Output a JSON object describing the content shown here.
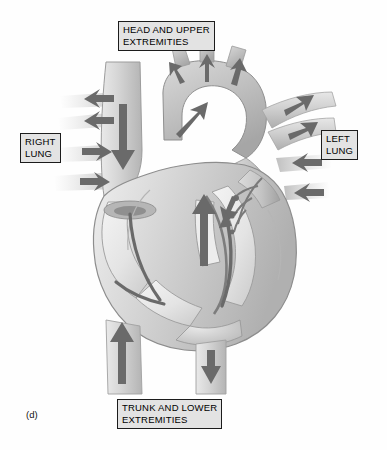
{
  "figure": {
    "panel_letter": "(d)",
    "title_text": "",
    "background_color": "#fefefe",
    "label_box_fill": "#e3e3e3",
    "label_box_border": "#1c1c1c"
  },
  "labels": {
    "head_upper": "HEAD AND UPPER\nEXTREMITIES",
    "right_lung": "RIGHT\nLUNG",
    "left_lung": "LEFT\nLUNG",
    "trunk_lower": "TRUNK AND LOWER\nEXTREMITIES"
  },
  "diagram": {
    "style": "grayscale anatomical illustration",
    "tones": {
      "tissue_light": "#e6e6e6",
      "tissue_mid": "#c9c9c9",
      "tissue_dark": "#a8a8a8",
      "chamber_pale": "#efefef",
      "vessel_light": "#dcdcdc",
      "arrow_gray": "#6e6e6e",
      "outline_gray": "#8a8a8a"
    },
    "structures": [
      "superior vena cava",
      "aortic arch",
      "brachiocephalic branches",
      "right pulmonary artery",
      "left pulmonary artery",
      "right pulmonary veins",
      "left pulmonary veins",
      "right atrium",
      "right ventricle",
      "left atrium",
      "left ventricle",
      "interventricular septum",
      "pulmonary trunk",
      "inferior vena cava",
      "descending aorta"
    ],
    "flow_arrows": [
      {
        "name": "superior-vena-cava-inflow",
        "direction": "down"
      },
      {
        "name": "aortic-arch-branch-1-outflow",
        "direction": "up"
      },
      {
        "name": "aortic-arch-branch-2-outflow",
        "direction": "up"
      },
      {
        "name": "aortic-arch-branch-3-outflow",
        "direction": "up"
      },
      {
        "name": "ascending-aorta-outflow",
        "direction": "up-right"
      },
      {
        "name": "right-pulmonary-artery-outflow",
        "direction": "left"
      },
      {
        "name": "right-pulmonary-artery-outflow-lower",
        "direction": "left"
      },
      {
        "name": "right-pulmonary-vein-inflow",
        "direction": "right"
      },
      {
        "name": "right-pulmonary-vein-inflow-lower",
        "direction": "right"
      },
      {
        "name": "left-pulmonary-artery-outflow",
        "direction": "right"
      },
      {
        "name": "left-pulmonary-artery-outflow-lower",
        "direction": "right"
      },
      {
        "name": "left-pulmonary-vein-inflow",
        "direction": "left"
      },
      {
        "name": "left-pulmonary-vein-inflow-lower",
        "direction": "left"
      },
      {
        "name": "right-atrium-to-ventricle-flow",
        "direction": "down-curve"
      },
      {
        "name": "right-ventricle-to-pulmonary-trunk-flow",
        "direction": "up"
      },
      {
        "name": "left-atrium-to-ventricle-flow",
        "direction": "down"
      },
      {
        "name": "left-ventricle-to-aorta-flow",
        "direction": "up"
      },
      {
        "name": "inferior-vena-cava-inflow",
        "direction": "up"
      },
      {
        "name": "descending-aorta-outflow",
        "direction": "down"
      }
    ]
  }
}
